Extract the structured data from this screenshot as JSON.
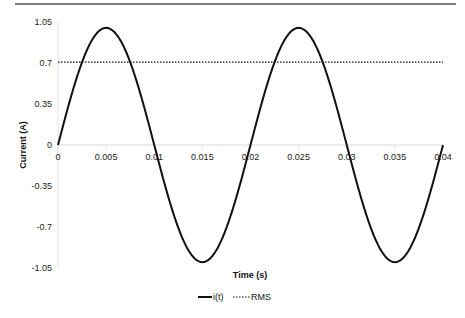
{
  "chart_data": {
    "type": "line",
    "title": "",
    "xlabel": "Time (s)",
    "ylabel": "Current (A)",
    "xlim": [
      0,
      0.04
    ],
    "ylim": [
      -1.05,
      1.05
    ],
    "x_ticks": [
      "0",
      "0.005",
      "0.01",
      "0.015",
      "0.02",
      "0.025",
      "0.03",
      "0.035",
      "0.04"
    ],
    "y_ticks": [
      "1.05",
      "0.7",
      "0.35",
      "0",
      "-0.35",
      "-0.7",
      "-1.05"
    ],
    "grid": false,
    "legend_position": "bottom",
    "series": [
      {
        "name": "i(t)",
        "style": "solid",
        "function": "sin(2*pi*50*t)",
        "amplitude": 1.0,
        "frequency_hz": 50,
        "x": [
          0,
          0.0025,
          0.005,
          0.0075,
          0.01,
          0.0125,
          0.015,
          0.0175,
          0.02,
          0.0225,
          0.025,
          0.0275,
          0.03,
          0.0325,
          0.035,
          0.0375,
          0.04
        ],
        "values": [
          0,
          0.707,
          1,
          0.707,
          0,
          -0.707,
          -1,
          -0.707,
          0,
          0.707,
          1,
          0.707,
          0,
          -0.707,
          -1,
          -0.707,
          0
        ]
      },
      {
        "name": "RMS",
        "style": "dotted",
        "x": [
          0,
          0.04
        ],
        "values": [
          0.707,
          0.707
        ]
      }
    ]
  },
  "legend": {
    "series1": "i(t)",
    "series2": "RMS"
  }
}
